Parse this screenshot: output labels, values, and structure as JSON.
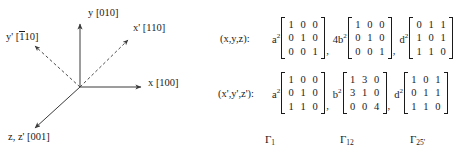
{
  "figure": {
    "name": "crystal-axes-diagram",
    "origin": {
      "x": 80,
      "y": 87
    },
    "axes": [
      {
        "id": "y",
        "label_symbol": "y",
        "label_index": "[010]",
        "style": "solid",
        "tip": {
          "x": 80,
          "y": 22
        }
      },
      {
        "id": "x",
        "label_symbol": "x",
        "label_index": "[100]",
        "style": "solid",
        "tip": {
          "x": 143,
          "y": 87
        }
      },
      {
        "id": "z",
        "label_symbol": "z, z'",
        "label_index": "[001]",
        "style": "solid",
        "tip": {
          "x": 33,
          "y": 130
        }
      },
      {
        "id": "xp",
        "label_symbol": "x'",
        "label_index": "[110]",
        "style": "dashed",
        "tip": {
          "x": 130,
          "y": 38
        }
      },
      {
        "id": "yp",
        "label_symbol": "y'",
        "label_index": "[110]",
        "label_index_overbar_first": true,
        "style": "dashed",
        "tip": {
          "x": 33,
          "y": 44
        }
      }
    ],
    "labels": {
      "y": {
        "symbol": "y",
        "index": "[010]"
      },
      "xp": {
        "symbol": "x'",
        "index": "[110]"
      },
      "yp": {
        "symbol": "y'",
        "index_open": "[",
        "index_bar_digit": "1",
        "index_rest": "10]"
      },
      "x": {
        "symbol": "x",
        "index": "[100]"
      },
      "z": {
        "symbol": "z, z'",
        "index": "[001]"
      }
    },
    "line_color": "#3a3a3a"
  },
  "matrices": {
    "rows": [
      {
        "id": "unprimed",
        "label": "(x,y,z):",
        "terms": [
          {
            "coef_base": "a",
            "coef_exp": "2",
            "values": [
              [
                "1",
                "0",
                "0"
              ],
              [
                "0",
                "1",
                "0"
              ],
              [
                "0",
                "0",
                "1"
              ]
            ],
            "trailing_comma": ","
          },
          {
            "coef_base": "4b",
            "coef_exp": "2",
            "values": [
              [
                "1",
                "0",
                "0"
              ],
              [
                "0",
                "1",
                "0"
              ],
              [
                "0",
                "0",
                "1"
              ]
            ],
            "trailing_comma": ","
          },
          {
            "coef_base": "d",
            "coef_exp": "2",
            "values": [
              [
                "0",
                "1",
                "1"
              ],
              [
                "1",
                "0",
                "1"
              ],
              [
                "1",
                "1",
                "0"
              ]
            ],
            "trailing_comma": ""
          }
        ]
      },
      {
        "id": "primed",
        "label": "(x',y',z'):",
        "terms": [
          {
            "coef_base": "a",
            "coef_exp": "2",
            "values": [
              [
                "1",
                "0",
                "0"
              ],
              [
                "0",
                "1",
                "0"
              ],
              [
                "1",
                "1",
                "0"
              ]
            ],
            "trailing_comma": ","
          },
          {
            "coef_base": "b",
            "coef_exp": "2",
            "values": [
              [
                "1",
                "3",
                "0"
              ],
              [
                "3",
                "1",
                "0"
              ],
              [
                "0",
                "0",
                "4"
              ]
            ],
            "trailing_comma": ","
          },
          {
            "coef_base": "d",
            "coef_exp": "2",
            "values": [
              [
                "1",
                "0",
                "1"
              ],
              [
                "0",
                "1",
                "1"
              ],
              [
                "1",
                "1",
                "0"
              ]
            ],
            "trailing_comma": ""
          }
        ]
      }
    ],
    "captions": [
      {
        "symbol": "Γ",
        "sub": "1"
      },
      {
        "symbol": "Γ",
        "sub": "12"
      },
      {
        "symbol": "Γ",
        "sub": "25'"
      }
    ]
  }
}
